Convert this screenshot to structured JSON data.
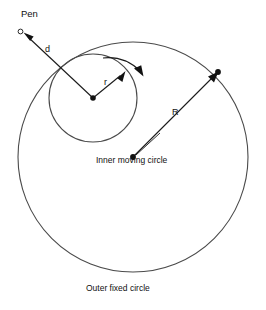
{
  "figure": {
    "type": "geometry-diagram",
    "background_color": "#ffffff",
    "stroke_color": "#1a1a1a",
    "circle_stroke_color": "#4a4a4a",
    "width": 266,
    "height": 310
  },
  "labels": {
    "pen": "Pen",
    "d": "d",
    "r": "r",
    "R": "R",
    "inner_circle": "Inner moving circle",
    "outer_circle": "Outer fixed circle"
  },
  "geometry": {
    "outer_circle": {
      "name": "Outer fixed circle",
      "center_x": 133,
      "center_y": 157,
      "radius": 115
    },
    "inner_circle": {
      "name": "Inner moving circle",
      "center_x": 93,
      "center_y": 98,
      "radius": 44
    },
    "pen_point": {
      "x": 20,
      "y": 31
    },
    "radius_r_arrow": {
      "label": "r",
      "from_x": 93,
      "from_y": 98,
      "to_x": 124,
      "to_y": 72
    },
    "radius_R_arrow": {
      "label": "R",
      "from_x": 133,
      "from_y": 157,
      "to_x": 218,
      "to_y": 72
    },
    "distance_d_arrow": {
      "label": "d",
      "from_x": 93,
      "from_y": 98,
      "to_x": 25,
      "to_y": 34
    },
    "rotation_arc": {
      "direction": "clockwise",
      "arrow_tip_x": 142,
      "arrow_tip_y": 73
    }
  },
  "label_positions": {
    "pen": {
      "x": 21,
      "y": 9
    },
    "d": {
      "x": 45,
      "y": 45
    },
    "r": {
      "x": 104,
      "y": 78
    },
    "R": {
      "x": 172,
      "y": 108
    },
    "inner_circle": {
      "x": 96,
      "y": 156
    },
    "outer_circle": {
      "x": 86,
      "y": 284
    }
  }
}
